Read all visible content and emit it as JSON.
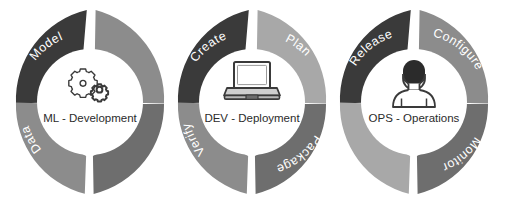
{
  "diagram": {
    "type": "three-overlapping-donut-rings",
    "background_color": "#ffffff"
  },
  "colors": {
    "dark": "#3a3a3a",
    "mid_dark": "#6e6e6e",
    "mid": "#8c8c8c",
    "light": "#a8a8a8",
    "gap": "#ffffff",
    "hub_fill": "#ffffff",
    "label_text": "#2b2b2b",
    "segment_text": "#ffffff",
    "icon_stroke": "#3a3a3a",
    "icon_fill_dark": "#2b2b2b",
    "icon_fill_gray": "#b5b5b5"
  },
  "rings": [
    {
      "id": "ml-development",
      "center_label": "ML - Development",
      "icon": "gears-icon",
      "cx": 90,
      "cy": 102,
      "segments": [
        {
          "label": "Model",
          "tone": "dark",
          "position": "top-left"
        },
        {
          "label": "",
          "tone": "mid",
          "position": "top-right"
        },
        {
          "label": "",
          "tone": "mid_dark",
          "position": "bottom-right"
        },
        {
          "label": "Data",
          "tone": "mid",
          "position": "bottom-left"
        }
      ]
    },
    {
      "id": "dev-deployment",
      "center_label": "DEV - Deployment",
      "icon": "laptop-icon",
      "cx": 252,
      "cy": 102,
      "segments": [
        {
          "label": "Create",
          "tone": "dark",
          "position": "top-left"
        },
        {
          "label": "Plan",
          "tone": "light",
          "position": "top-right"
        },
        {
          "label": "Package",
          "tone": "mid_dark",
          "position": "bottom-right"
        },
        {
          "label": "Verify",
          "tone": "mid",
          "position": "bottom-left"
        }
      ]
    },
    {
      "id": "ops-operations",
      "center_label": "OPS - Operations",
      "icon": "person-icon",
      "cx": 414,
      "cy": 102,
      "segments": [
        {
          "label": "Release",
          "tone": "dark",
          "position": "top-left"
        },
        {
          "label": "Configure",
          "tone": "mid",
          "position": "top-right"
        },
        {
          "label": "Monitor",
          "tone": "mid_dark",
          "position": "bottom-right"
        },
        {
          "label": "",
          "tone": "light",
          "position": "bottom-left"
        }
      ]
    }
  ]
}
